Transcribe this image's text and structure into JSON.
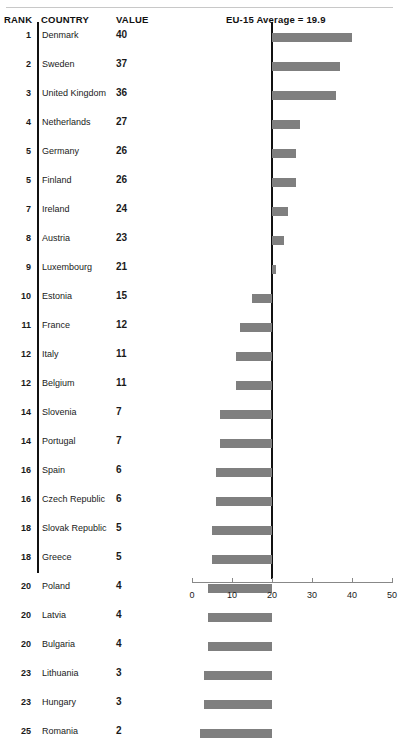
{
  "header": {
    "rank_label": "RANK",
    "country_label": "COUNTRY",
    "value_label": "VALUE",
    "average_label": "EU-15 Average = 19.9"
  },
  "chart_data": {
    "type": "bar",
    "title": "EU-15 Average = 19.9",
    "orientation": "horizontal",
    "xlabel": "",
    "ylabel": "",
    "xlim": [
      0,
      50
    ],
    "xticks": [
      0,
      10,
      20,
      30,
      40,
      50
    ],
    "xtick_labels": [
      "0",
      "10",
      "20",
      "30",
      "40",
      "50"
    ],
    "grid": false,
    "legend": null,
    "reference_line": 20,
    "reference_line_label": "EU-15 Average = 19.9",
    "reference_value": 19.9,
    "bar_color": "#7f7f7f",
    "columns": [
      "RANK",
      "COUNTRY",
      "VALUE"
    ],
    "categories": [
      "Denmark",
      "Sweden",
      "United Kingdom",
      "Netherlands",
      "Germany",
      "Finland",
      "Ireland",
      "Austria",
      "Luxembourg",
      "Estonia",
      "France",
      "Italy",
      "Belgium",
      "Slovenia",
      "Portugal",
      "Spain",
      "Czech Republic",
      "Slovak Republic",
      "Greece",
      "Poland",
      "Latvia",
      "Bulgaria",
      "Lithuania",
      "Hungary",
      "Romania"
    ],
    "values": [
      40,
      37,
      36,
      27,
      26,
      26,
      24,
      23,
      21,
      15,
      12,
      11,
      11,
      7,
      7,
      6,
      6,
      5,
      5,
      4,
      4,
      4,
      3,
      3,
      2
    ],
    "ranks": [
      1,
      2,
      3,
      4,
      5,
      5,
      7,
      8,
      9,
      10,
      11,
      12,
      12,
      14,
      14,
      16,
      16,
      18,
      18,
      20,
      20,
      20,
      23,
      23,
      25
    ],
    "rows": [
      {
        "rank": "1",
        "country": "Denmark",
        "value": "40",
        "v": 40
      },
      {
        "rank": "2",
        "country": "Sweden",
        "value": "37",
        "v": 37
      },
      {
        "rank": "3",
        "country": "United Kingdom",
        "value": "36",
        "v": 36
      },
      {
        "rank": "4",
        "country": "Netherlands",
        "value": "27",
        "v": 27
      },
      {
        "rank": "5",
        "country": "Germany",
        "value": "26",
        "v": 26
      },
      {
        "rank": "5",
        "country": "Finland",
        "value": "26",
        "v": 26
      },
      {
        "rank": "7",
        "country": "Ireland",
        "value": "24",
        "v": 24
      },
      {
        "rank": "8",
        "country": "Austria",
        "value": "23",
        "v": 23
      },
      {
        "rank": "9",
        "country": "Luxembourg",
        "value": "21",
        "v": 21
      },
      {
        "rank": "10",
        "country": "Estonia",
        "value": "15",
        "v": 15
      },
      {
        "rank": "11",
        "country": "France",
        "value": "12",
        "v": 12
      },
      {
        "rank": "12",
        "country": "Italy",
        "value": "11",
        "v": 11
      },
      {
        "rank": "12",
        "country": "Belgium",
        "value": "11",
        "v": 11
      },
      {
        "rank": "14",
        "country": "Slovenia",
        "value": "7",
        "v": 7
      },
      {
        "rank": "14",
        "country": "Portugal",
        "value": "7",
        "v": 7
      },
      {
        "rank": "16",
        "country": "Spain",
        "value": "6",
        "v": 6
      },
      {
        "rank": "16",
        "country": "Czech Republic",
        "value": "6",
        "v": 6
      },
      {
        "rank": "18",
        "country": "Slovak Republic",
        "value": "5",
        "v": 5
      },
      {
        "rank": "18",
        "country": "Greece",
        "value": "5",
        "v": 5
      },
      {
        "rank": "20",
        "country": "Poland",
        "value": "4",
        "v": 4
      },
      {
        "rank": "20",
        "country": "Latvia",
        "value": "4",
        "v": 4
      },
      {
        "rank": "20",
        "country": "Bulgaria",
        "value": "4",
        "v": 4
      },
      {
        "rank": "23",
        "country": "Lithuania",
        "value": "3",
        "v": 3
      },
      {
        "rank": "23",
        "country": "Hungary",
        "value": "3",
        "v": 3
      },
      {
        "rank": "25",
        "country": "Romania",
        "value": "2",
        "v": 2
      }
    ]
  }
}
